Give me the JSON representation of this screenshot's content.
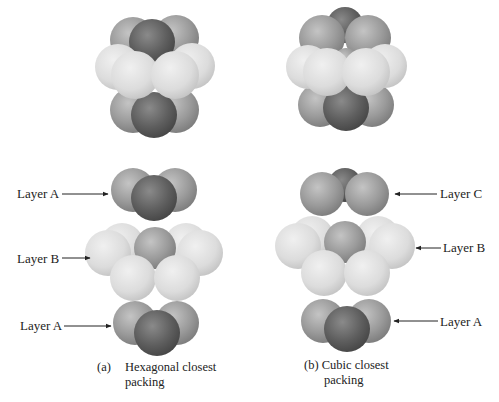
{
  "figure": {
    "panels": [
      {
        "id": "a",
        "caption_marker": "(a)",
        "caption_line1": "Hexagonal closest",
        "caption_line2": "packing",
        "layers": [
          {
            "label": "Layer A",
            "side": "left"
          },
          {
            "label": "Layer B",
            "side": "left"
          },
          {
            "label": "Layer A",
            "side": "left"
          }
        ]
      },
      {
        "id": "b",
        "caption_marker": "(b)",
        "caption_line1": "(b) Cubic closest",
        "caption_line2": "packing",
        "layers": [
          {
            "label": "Layer C",
            "side": "right"
          },
          {
            "label": "Layer B",
            "side": "right"
          },
          {
            "label": "Layer A",
            "side": "right"
          }
        ]
      }
    ]
  },
  "colors": {
    "background": "#ffffff",
    "dark_sphere": "#5a5a5a",
    "mid_sphere": "#8c8c8c",
    "light_sphere": "#d8d8d8",
    "text": "#222222"
  }
}
